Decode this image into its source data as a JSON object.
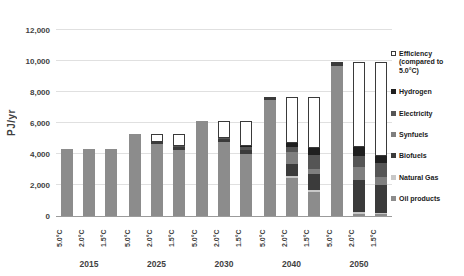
{
  "chart_data": {
    "type": "bar",
    "stacked": true,
    "title": "",
    "ylabel": "PJ/yr",
    "ylim": [
      0,
      12000
    ],
    "grid": true,
    "legend_position": "right",
    "yticks": [
      {
        "value": 0,
        "label": "0"
      },
      {
        "value": 2000,
        "label": "2,000"
      },
      {
        "value": 4000,
        "label": "4,000"
      },
      {
        "value": 6000,
        "label": "6,000"
      },
      {
        "value": 8000,
        "label": "8,000"
      },
      {
        "value": 10000,
        "label": "10,000"
      },
      {
        "value": 12000,
        "label": "12,000"
      }
    ],
    "years": [
      "2015",
      "2025",
      "2030",
      "2040",
      "2050"
    ],
    "scenarios": [
      "5.0°C",
      "2.0°C",
      "1.5°C"
    ],
    "bar_order_note": "15 bars: one per scenario per year, values arrays run 2015 5.0/2.0/1.5, 2025 5.0/2.0/1.5, 2030, 2040, 2050",
    "series": [
      {
        "name": "Oil products",
        "key": "oil-products",
        "color": "#8c8c8c",
        "values": [
          4300,
          4300,
          4300,
          5300,
          4650,
          4250,
          6150,
          4750,
          3980,
          7500,
          2450,
          1550,
          9700,
          150,
          100
        ]
      },
      {
        "name": "Natural Gas",
        "key": "natural-gas",
        "color": "#c8c8c8",
        "values": [
          0,
          0,
          0,
          0,
          0,
          0,
          0,
          0,
          0,
          0,
          100,
          100,
          0,
          100,
          100
        ]
      },
      {
        "name": "Biofuels",
        "key": "biofuels",
        "color": "#3b3b3b",
        "values": [
          0,
          0,
          0,
          0,
          100,
          200,
          0,
          200,
          300,
          200,
          800,
          1050,
          250,
          2050,
          1800
        ]
      },
      {
        "name": "Synfuels",
        "key": "synfuels",
        "color": "#7f7f7f",
        "values": [
          0,
          0,
          0,
          0,
          0,
          0,
          0,
          0,
          0,
          0,
          750,
          350,
          0,
          850,
          500
        ]
      },
      {
        "name": "Electricity",
        "key": "electricity",
        "color": "#555555",
        "values": [
          0,
          0,
          0,
          0,
          0,
          50,
          0,
          100,
          150,
          0,
          350,
          900,
          0,
          750,
          950
        ]
      },
      {
        "name": "Hydrogen",
        "key": "hydrogen",
        "color": "#1f1f1f",
        "values": [
          0,
          0,
          0,
          0,
          0,
          0,
          0,
          0,
          70,
          0,
          250,
          450,
          0,
          550,
          450
        ]
      },
      {
        "name": "Efficiency (compared to 5.0°C)",
        "key": "efficiency",
        "color": "#ffffff",
        "border": "#3a3a3a",
        "legend_label": "Efficiency\n(compared to\n5.0°C)",
        "values": [
          0,
          0,
          0,
          0,
          550,
          800,
          0,
          1100,
          1650,
          0,
          3000,
          3300,
          0,
          5500,
          6050
        ]
      }
    ],
    "legend_order": [
      "efficiency",
      "hydrogen",
      "electricity",
      "synfuels",
      "biofuels",
      "natural-gas",
      "oil-products"
    ]
  }
}
